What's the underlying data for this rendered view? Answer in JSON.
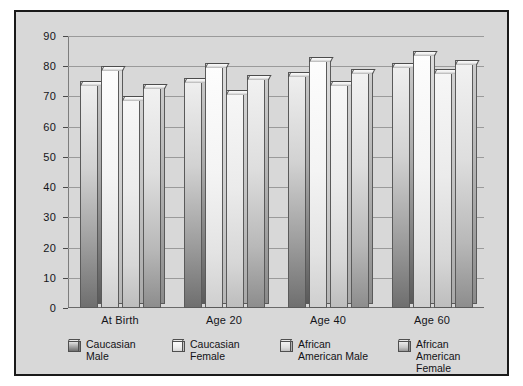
{
  "chart_data": {
    "type": "bar",
    "title": "",
    "subtitle": "",
    "xlabel": "",
    "ylabel": "",
    "categories": [
      "At Birth",
      "Age 20",
      "Age 40",
      "Age 60"
    ],
    "series": [
      {
        "name": "Caucasian Male",
        "legend_label": "Caucasian\nMale",
        "values": [
          75,
          76,
          78,
          81
        ]
      },
      {
        "name": "Caucasian Female",
        "legend_label": "Caucasian\nFemale",
        "values": [
          80,
          81,
          83,
          85
        ]
      },
      {
        "name": "African American Male",
        "legend_label": "African\nAmerican Male",
        "values": [
          70,
          72,
          75,
          79
        ]
      },
      {
        "name": "African American Female",
        "legend_label": "African\nAmerican Female",
        "values": [
          74,
          77,
          79,
          82
        ]
      }
    ],
    "ylim": [
      0,
      90
    ],
    "yticks": [
      0,
      10,
      20,
      30,
      40,
      50,
      60,
      70,
      80,
      90
    ],
    "ytick_labels": [
      "0",
      "10",
      "20",
      "30",
      "40",
      "50",
      "60",
      "70",
      "80",
      "90"
    ],
    "grid": true,
    "grid_axis": "y",
    "legend_position": "bottom",
    "style": "3d-bar",
    "colors": {
      "figure_background": "#d8d8d8",
      "page_background": "#ffffff",
      "border": "#1a1a1a",
      "gridline": "#9a9a9a",
      "text": "#15151a"
    }
  }
}
